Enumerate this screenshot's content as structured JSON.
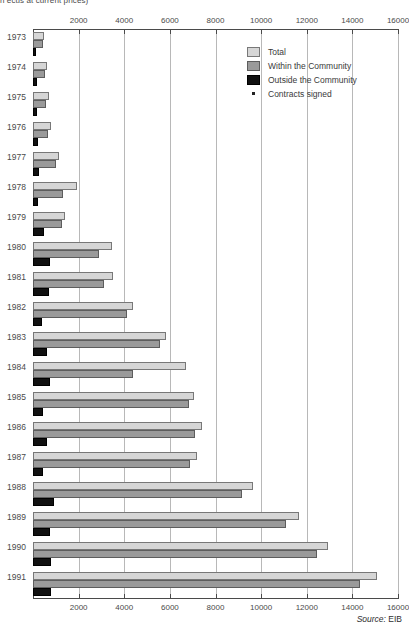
{
  "subtitle": "n ecus at current prices)",
  "source": {
    "label": "Source:",
    "value": "EIB"
  },
  "legend": {
    "items": [
      {
        "key": "total",
        "label": "Total"
      },
      {
        "key": "within",
        "label": "Within the Community"
      },
      {
        "key": "outside",
        "label": "Outside the Community"
      },
      {
        "key": "signed",
        "label": "Contracts signed"
      }
    ]
  },
  "colors": {
    "total": "#d6d6d6",
    "within": "#9a9a9a",
    "outside": "#111111",
    "gridline": "#b8b8b8",
    "axis": "#4a4a4a",
    "text": "#3a3a3a"
  },
  "chart_data": {
    "type": "bar",
    "orientation": "horizontal",
    "title": "",
    "subtitle": "n ecus at current prices)",
    "xlabel": "",
    "ylabel": "",
    "xlim": [
      0,
      16000
    ],
    "xticks": [
      0,
      2000,
      4000,
      6000,
      8000,
      10000,
      12000,
      14000,
      16000
    ],
    "xticklabels": [
      "",
      "2000",
      "4000",
      "6000",
      "8000",
      "10000",
      "12000",
      "14000",
      "16000"
    ],
    "grid": true,
    "grid_axis": "x",
    "legend_position": "top-right",
    "axis_top": true,
    "axis_bottom": true,
    "categories": [
      "1973",
      "1974",
      "1975",
      "1976",
      "1977",
      "1978",
      "1979",
      "1980",
      "1981",
      "1982",
      "1983",
      "1984",
      "1985",
      "1986",
      "1987",
      "1988",
      "1989",
      "1990",
      "1991"
    ],
    "series": [
      {
        "name": "Total",
        "color": "#d6d6d6",
        "values": [
          480,
          620,
          680,
          780,
          1150,
          1950,
          1400,
          3450,
          3500,
          4400,
          5850,
          6700,
          7050,
          7400,
          7200,
          9650,
          11650,
          12950,
          15100
        ]
      },
      {
        "name": "Within the Community",
        "color": "#9a9a9a",
        "values": [
          420,
          520,
          580,
          640,
          1000,
          1300,
          1250,
          2900,
          3100,
          4100,
          5550,
          4400,
          6850,
          7100,
          6900,
          9150,
          11100,
          12450,
          14350
        ]
      },
      {
        "name": "Outside the Community",
        "color": "#111111",
        "values": [
          120,
          170,
          180,
          200,
          260,
          220,
          470,
          760,
          700,
          380,
          600,
          760,
          440,
          620,
          430,
          900,
          740,
          790,
          800
        ]
      }
    ]
  }
}
